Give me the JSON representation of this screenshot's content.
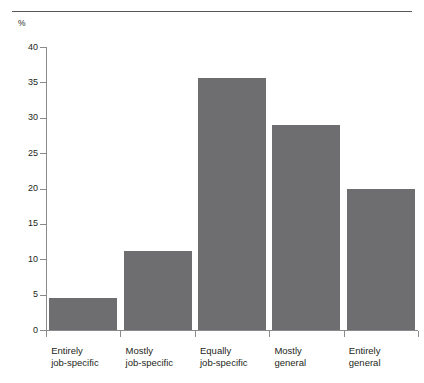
{
  "figure": {
    "name": "bar-chart-figure",
    "y_unit_label": "%",
    "top_rule": true
  },
  "chart_data": {
    "type": "bar",
    "title": "",
    "subtitle": "",
    "xlabel": "",
    "ylabel": "%",
    "ylim": [
      0,
      40
    ],
    "yticks": [
      0,
      5,
      10,
      15,
      20,
      25,
      30,
      35,
      40
    ],
    "ytick_labels": [
      "0",
      "5",
      "10",
      "15",
      "20",
      "25",
      "30",
      "35",
      "40"
    ],
    "grid": false,
    "legend": null,
    "categories": [
      "Entirely job-specific",
      "Mostly job-specific",
      "Equally job-specific",
      "Mostly general",
      "Entirely general"
    ],
    "category_lines": [
      [
        "Entirely",
        "job-specific"
      ],
      [
        "Mostly",
        "job-specific"
      ],
      [
        "Equally",
        "job-specific"
      ],
      [
        "Mostly",
        "general"
      ],
      [
        "Entirely",
        "general"
      ]
    ],
    "values": [
      4.5,
      11.1,
      35.6,
      29.0,
      20.0
    ],
    "bar_color": "#6e6e70",
    "axis_color": "#8a8a8c",
    "text_color": "#231f20"
  }
}
